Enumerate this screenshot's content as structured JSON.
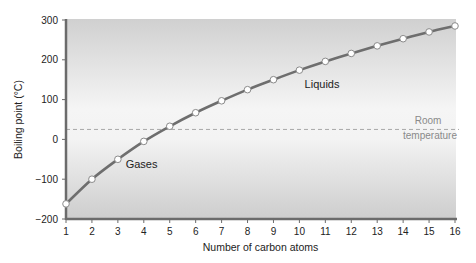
{
  "chart_data": {
    "type": "line",
    "title": "",
    "xlabel": "Number of carbon atoms",
    "ylabel": "Boiling point (°C)",
    "x": [
      1,
      2,
      3,
      4,
      5,
      6,
      7,
      8,
      9,
      10,
      11,
      12,
      13,
      14,
      15,
      16
    ],
    "series": [
      {
        "name": "Boiling point",
        "values": [
          -162,
          -100,
          -50,
          -5,
          33,
          67,
          97,
          125,
          150,
          174,
          196,
          216,
          235,
          253,
          270,
          285
        ]
      }
    ],
    "reference_line": {
      "y": 25,
      "label_line1": "Room",
      "label_line2": "temperature",
      "style": "dashed"
    },
    "annotations": [
      {
        "text": "Gases",
        "x": 3.3,
        "y": -73
      },
      {
        "text": "Liquids",
        "x": 10.2,
        "y": 128
      }
    ],
    "xlim": [
      1,
      16
    ],
    "ylim": [
      -200,
      300
    ],
    "xticks": [
      "1",
      "2",
      "3",
      "4",
      "5",
      "6",
      "7",
      "8",
      "9",
      "10",
      "11",
      "12",
      "13",
      "14",
      "15",
      "16"
    ],
    "yticks": [
      "300",
      "200",
      "100",
      "0",
      "-100",
      "-200"
    ],
    "grid": false,
    "legend": "none"
  },
  "colors": {
    "line": "#6e6e6e",
    "marker_fill": "#ffffff",
    "axis": "#6b6b6b",
    "room_line": "#a8a8a8",
    "bg_top": "#d2d2d2",
    "bg_mid": "#f4f4f4",
    "bg_bottom": "#cfcfcf"
  }
}
